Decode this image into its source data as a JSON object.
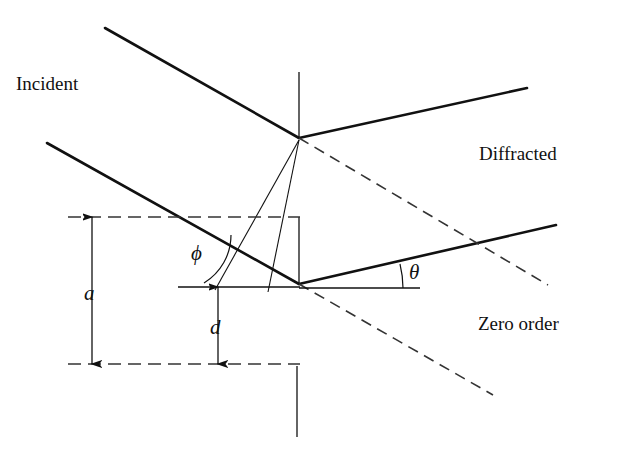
{
  "figure": {
    "width": 631,
    "height": 459,
    "background_color": "#ffffff",
    "stroke_color": "#111111"
  },
  "labels": {
    "incident": "Incident",
    "diffracted": "Diffracted",
    "zero_order": "Zero order",
    "groove_spacing": "a",
    "groove_depth": "d",
    "blaze_angle": "ϕ",
    "diffraction_angle": "θ"
  },
  "geometry": {
    "apex_upper": {
      "x": 299,
      "y": 138
    },
    "apex_lower": {
      "x": 299,
      "y": 284
    },
    "normal_upper": {
      "x1": 299,
      "y1": 72,
      "x2": 299,
      "y2": 138
    },
    "normal_lower": {
      "x1": 299,
      "y1": 217,
      "x2": 299,
      "y2": 284
    },
    "normal_bottom": {
      "x1": 297,
      "y1": 366,
      "x2": 297,
      "y2": 437
    },
    "incident_rays": [
      {
        "x1": 105,
        "y1": 28,
        "x2": 299,
        "y2": 138
      },
      {
        "x1": 47,
        "y1": 143,
        "x2": 299,
        "y2": 284
      }
    ],
    "diffracted_rays": [
      {
        "x1": 299,
        "y1": 138,
        "x2": 527,
        "y2": 88
      },
      {
        "x1": 299,
        "y1": 284,
        "x2": 556,
        "y2": 225
      }
    ],
    "zero_order_dashed": [
      {
        "x1": 299,
        "y1": 138,
        "x2": 548,
        "y2": 285
      },
      {
        "x1": 299,
        "y1": 284,
        "x2": 493,
        "y2": 395
      }
    ],
    "wavefront_lines": [
      {
        "x1": 299,
        "y1": 140,
        "x2": 215,
        "y2": 290
      },
      {
        "x1": 299,
        "y1": 140,
        "x2": 268,
        "y2": 292
      }
    ],
    "dashed_horizontals": [
      {
        "x1": 68,
        "y": 217,
        "x2": 300
      },
      {
        "x1": 68,
        "y": 364,
        "x2": 300
      }
    ],
    "solid_short_horizontals": [
      {
        "x1": 178,
        "y": 287,
        "x2": 300
      },
      {
        "x1": 299,
        "y": 288,
        "x2": 420
      }
    ],
    "dimension_arrows": [
      {
        "name": "a",
        "x": 92,
        "y1": 217,
        "y2": 364
      },
      {
        "name": "d",
        "x": 218,
        "y1": 287,
        "y2": 364
      }
    ],
    "angle_arcs": [
      {
        "name": "phi",
        "cx": 204,
        "cy": 287,
        "r": 52,
        "start_deg": 180,
        "end_deg": 239
      },
      {
        "name": "theta",
        "cx": 299,
        "cy": 288,
        "r": 115,
        "start_deg": 0,
        "end_deg": -13
      }
    ]
  }
}
